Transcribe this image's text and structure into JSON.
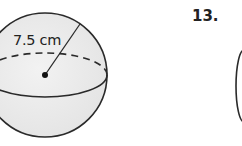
{
  "figure": {
    "shape": "sphere",
    "radius_label": "7.5 cm",
    "fill_color": "#ececec",
    "stroke_color": "#2a2a2a"
  },
  "next_problem": {
    "number": "13."
  }
}
